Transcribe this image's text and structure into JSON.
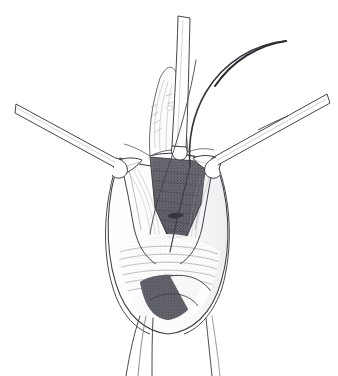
{
  "figure": {
    "domain": "illustration",
    "medium": "pen-and-ink line drawing with graphite hatching",
    "background_color": "#ffffff",
    "ink_color": "#3a3a3e",
    "hatch_color": "#8e8e96",
    "shadow_fill": "#5e5e66",
    "canvas": {
      "width": 338,
      "height": 376
    }
  },
  "caption": {
    "text": "",
    "note_visible": "bottom edge shows a clipped, illegible partial line of faint gray text"
  },
  "elements": {
    "left_retractor_label": "left retractor",
    "right_retractor_label": "right retractor",
    "vertical_instrument_label": "vertical instrument shaft",
    "needle_label": "curved needle with suture",
    "wound_cavity_label": "incision cavity",
    "tissue_flap_left_label": "left tissue flap",
    "tissue_flap_right_label": "right tissue flap",
    "tissue_strand_label": "trailing tissue strand",
    "dark_mark_label": "small dark crescent marking"
  }
}
